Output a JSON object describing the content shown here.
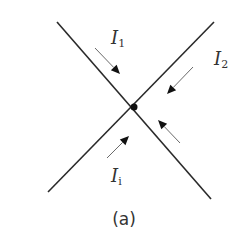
{
  "diagram": {
    "caption": "(a)",
    "node": {
      "x": 134,
      "y": 107,
      "r": 3.5
    },
    "lines": [
      {
        "id": "line-1",
        "x1": 57,
        "y1": 22,
        "x2": 211,
        "y2": 199
      },
      {
        "id": "line-2",
        "x1": 214,
        "y1": 22,
        "x2": 48,
        "y2": 192
      }
    ],
    "arrows": [
      {
        "id": "arrow-I1",
        "x1": 95,
        "y1": 48,
        "x2": 120,
        "y2": 74
      },
      {
        "id": "arrow-I2",
        "x1": 193,
        "y1": 67,
        "x2": 167,
        "y2": 94
      },
      {
        "id": "arrow-lower-right",
        "x1": 180,
        "y1": 143,
        "x2": 158,
        "y2": 120
      },
      {
        "id": "arrow-Ii",
        "x1": 107,
        "y1": 158,
        "x2": 129,
        "y2": 136
      }
    ],
    "labels": [
      {
        "id": "I1",
        "main": "I",
        "sub": "1",
        "x": 111,
        "y": 29
      },
      {
        "id": "I2",
        "main": "I",
        "sub": "2",
        "x": 214,
        "y": 50
      },
      {
        "id": "Ii",
        "main": "I",
        "sub": "i",
        "x": 111,
        "y": 167
      }
    ],
    "colors": {
      "line": "#2a2a2a",
      "arrow_shaft": "#6a6a6a",
      "arrow_head": "#111111",
      "text": "#333333"
    }
  }
}
